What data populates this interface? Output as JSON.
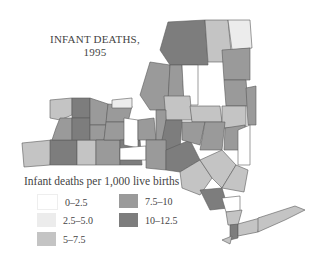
{
  "title": {
    "line1": "INFANT DEATHS,",
    "line2": "1995"
  },
  "legend": {
    "title": "Infant deaths per 1,000 live births",
    "items": [
      {
        "label": "0–2.5",
        "color": "#ffffff"
      },
      {
        "label": "2.5–5.0",
        "color": "#ececec"
      },
      {
        "label": "5–7.5",
        "color": "#c4c4c4"
      },
      {
        "label": "7.5–10",
        "color": "#9a9a9a"
      },
      {
        "label": "10–12.5",
        "color": "#7d7d7d"
      }
    ]
  },
  "map": {
    "region": "New York State counties",
    "year": "1995"
  }
}
